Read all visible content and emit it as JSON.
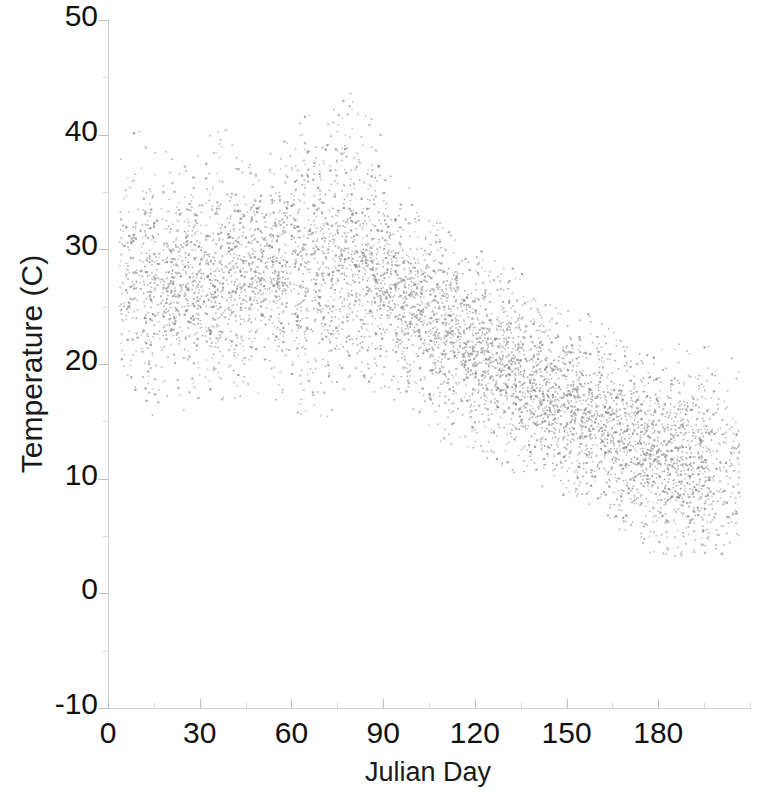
{
  "chart_data": {
    "type": "scatter",
    "title": "",
    "xlabel": "Julian Day",
    "ylabel": "Temperature (C)",
    "xlim": [
      0,
      210
    ],
    "ylim": [
      -10,
      50
    ],
    "xticks": [
      0,
      30,
      60,
      90,
      120,
      150,
      180
    ],
    "yticks": [
      -10,
      0,
      10,
      20,
      30,
      40,
      50
    ],
    "xtick_labels": [
      "0",
      "30",
      "60",
      "90",
      "120",
      "150",
      "180"
    ],
    "ytick_labels": [
      "-10",
      "0",
      "10",
      "20",
      "30",
      "40",
      "50"
    ],
    "grid": false,
    "legend": null,
    "marker": {
      "shape": "dot",
      "color": "#8c8c8c",
      "size_px": 2,
      "opacity": 0.85
    },
    "envelope": {
      "comment": "Approximate upper and lower bounds of the point cloud at sampled Julian days.",
      "day": [
        5,
        10,
        15,
        20,
        25,
        30,
        35,
        40,
        45,
        50,
        55,
        60,
        65,
        70,
        75,
        80,
        85,
        90,
        95,
        100,
        105,
        110,
        115,
        120,
        125,
        130,
        135,
        140,
        145,
        150,
        155,
        160,
        165,
        170,
        175,
        180,
        185,
        190,
        195,
        200,
        205
      ],
      "ymax": [
        39.5,
        41.0,
        40.5,
        38.5,
        37.5,
        39.5,
        40.5,
        41.0,
        38.0,
        36.5,
        40.0,
        42.0,
        43.0,
        42.5,
        43.0,
        44.0,
        42.5,
        40.0,
        37.0,
        34.5,
        33.0,
        32.0,
        31.0,
        30.5,
        30.0,
        29.0,
        28.0,
        27.0,
        26.0,
        25.5,
        25.0,
        24.0,
        23.5,
        23.0,
        22.5,
        22.0,
        22.0,
        22.0,
        22.0,
        22.0,
        22.0
      ],
      "ymin": [
        19.0,
        17.5,
        15.0,
        15.5,
        16.0,
        16.5,
        16.5,
        17.0,
        17.0,
        17.0,
        16.5,
        16.0,
        15.0,
        14.5,
        16.0,
        18.0,
        18.0,
        17.0,
        16.0,
        15.0,
        14.0,
        13.0,
        12.5,
        12.0,
        11.5,
        11.0,
        10.0,
        9.5,
        9.0,
        8.5,
        8.0,
        7.0,
        6.0,
        5.0,
        4.0,
        3.0,
        3.0,
        3.5,
        3.0,
        3.0,
        5.0
      ]
    },
    "trend": {
      "comment": "Approximate centre (median) of the point cloud at sampled Julian days.",
      "day": [
        5,
        20,
        40,
        60,
        80,
        100,
        120,
        140,
        160,
        180,
        200
      ],
      "median_temperature": [
        28.0,
        27.0,
        28.0,
        29.0,
        29.5,
        25.0,
        21.0,
        18.0,
        15.0,
        12.0,
        11.0
      ]
    },
    "n_points_estimate": 6000
  }
}
